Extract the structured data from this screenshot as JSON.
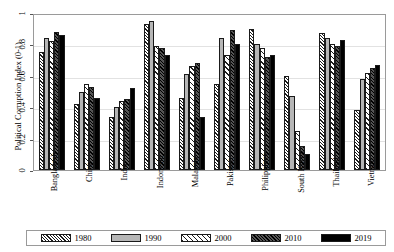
{
  "chart_data": {
    "type": "bar",
    "title": "",
    "xlabel": "",
    "ylabel": "Political Corruption Index (0-1)",
    "ylim": [
      0,
      1
    ],
    "yticks": [
      "0",
      "0.2",
      "0.4",
      "0.6",
      "0.8",
      "1"
    ],
    "grid": true,
    "legend_position": "bottom",
    "categories": [
      "Bangladesh",
      "China",
      "India",
      "Indonesia",
      "Malaysia",
      "Pakistan",
      "Philippines",
      "South Korea",
      "Thailand",
      "Vietnam"
    ],
    "series": [
      {
        "name": "1980",
        "color": "#ffffff",
        "pattern": "dense-diagonal-hatch",
        "values": [
          0.75,
          0.42,
          0.34,
          0.93,
          0.46,
          0.55,
          0.9,
          0.6,
          0.87,
          0.38
        ]
      },
      {
        "name": "1990",
        "color": "#b6b6b6",
        "pattern": "solid-light-gray",
        "values": [
          0.84,
          0.5,
          0.4,
          0.95,
          0.61,
          0.84,
          0.8,
          0.47,
          0.84,
          0.58
        ]
      },
      {
        "name": "2000",
        "color": "#ffffff",
        "pattern": "sparse-diagonal-hatch",
        "values": [
          0.82,
          0.55,
          0.44,
          0.79,
          0.66,
          0.73,
          0.78,
          0.25,
          0.8,
          0.62
        ]
      },
      {
        "name": "2010",
        "color": "#3a3a3a",
        "pattern": "dark-diagonal-hatch",
        "values": [
          0.88,
          0.53,
          0.45,
          0.78,
          0.68,
          0.89,
          0.72,
          0.15,
          0.79,
          0.65
        ]
      },
      {
        "name": "2019",
        "color": "#000000",
        "pattern": "solid-black",
        "values": [
          0.86,
          0.46,
          0.52,
          0.73,
          0.34,
          0.8,
          0.73,
          0.1,
          0.83,
          0.67
        ]
      }
    ]
  }
}
